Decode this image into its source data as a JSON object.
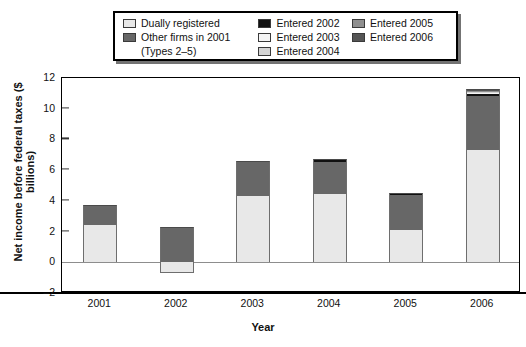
{
  "legend": {
    "columns": [
      {
        "items": [
          {
            "label": "Dually registered",
            "color": "#e8e8e8",
            "name": "legend-dually-registered"
          },
          {
            "label": "Other firms in 2001",
            "color": "#676767",
            "name": "legend-other-firms-2001"
          }
        ],
        "subtext": "(Types 2–5)"
      },
      {
        "items": [
          {
            "label": "Entered 2002",
            "color": "#111111",
            "name": "legend-entered-2002"
          },
          {
            "label": "Entered 2003",
            "color": "#f5f5f5",
            "name": "legend-entered-2003"
          },
          {
            "label": "Entered 2004",
            "color": "#d4d4d4",
            "name": "legend-entered-2004"
          }
        ],
        "subtext": ""
      },
      {
        "items": [
          {
            "label": "Entered 2005",
            "color": "#8f8f8f",
            "name": "legend-entered-2005"
          },
          {
            "label": "Entered 2006",
            "color": "#555555",
            "name": "legend-entered-2006"
          }
        ],
        "subtext": ""
      }
    ]
  },
  "chart_data": {
    "type": "bar",
    "stacked": true,
    "title": "",
    "xlabel": "Year",
    "ylabel": "Net income before federal taxes ($ billions)",
    "categories": [
      "2001",
      "2002",
      "2003",
      "2004",
      "2005",
      "2006"
    ],
    "ylim": [
      -2,
      12
    ],
    "yticks": [
      -2,
      0,
      2,
      4,
      6,
      8,
      10,
      12
    ],
    "grid": false,
    "legend_position": "above-plot",
    "series": [
      {
        "name": "Dually registered",
        "color": "#e8e8e8",
        "values": [
          2.4,
          -0.7,
          4.3,
          4.45,
          2.1,
          7.3
        ]
      },
      {
        "name": "Other firms in 2001 (Types 2–5)",
        "color": "#676767",
        "values": [
          1.3,
          2.3,
          2.3,
          2.05,
          2.25,
          3.5
        ]
      },
      {
        "name": "Entered 2002",
        "color": "#111111",
        "values": [
          0,
          0,
          0,
          0.2,
          0.15,
          0.15
        ]
      },
      {
        "name": "Entered 2003",
        "color": "#f5f5f5",
        "values": [
          0,
          0,
          0,
          0,
          0,
          0.08
        ]
      },
      {
        "name": "Entered 2004",
        "color": "#d4d4d4",
        "values": [
          0,
          0,
          0,
          0,
          0,
          0.08
        ]
      },
      {
        "name": "Entered 2005",
        "color": "#8f8f8f",
        "values": [
          0,
          0,
          0,
          0,
          0,
          0.05
        ]
      },
      {
        "name": "Entered 2006",
        "color": "#555555",
        "values": [
          0,
          0,
          0,
          0,
          0,
          0.1
        ]
      }
    ],
    "totals": [
      3.7,
      1.6,
      6.6,
      6.7,
      4.5,
      11.26
    ]
  }
}
